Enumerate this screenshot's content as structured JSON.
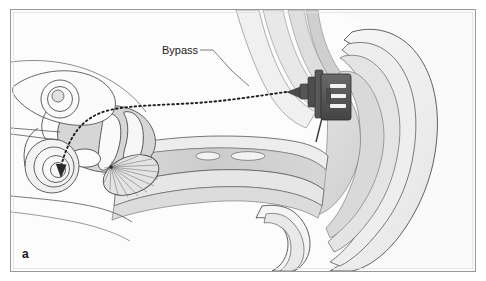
{
  "figure": {
    "domain": "Diagram",
    "panel_letter": "a",
    "background_color": "#ffffff",
    "frame": {
      "border_color": "#9a9a9a",
      "inner_border_color": "#d8d8d8",
      "x": 10,
      "y": 9,
      "width": 466,
      "height": 263
    },
    "annotations": [
      {
        "id": "bypass",
        "label": "Bypass",
        "text_x": 162,
        "text_y": 54,
        "leader_color": "#6f6f6f",
        "leader_path": "M 200 50 L 213 50 L 232 71 L 249 86"
      }
    ],
    "bypass_route": {
      "name": "bypass-dotted-path",
      "color": "#1e1e1e",
      "dash": "1.6 3.1",
      "width": 1.9,
      "path": "M 286 92 C 258 96 226 101 196 103 C 166 105 132 105 110 110 C 92 114 80 124 72 138 C 66 149 63 159 61 166",
      "arrow_points": "61,177 56.4,163.6 66.2,164.2",
      "arrow_color": "#2a2a2a"
    },
    "device": {
      "name": "implant-device",
      "body_color": "#595959",
      "body_stroke": "#2e2e2e",
      "mid_color": "#4e4e4e",
      "slot_color": "#f2f2f2",
      "taper_color": "#4a4a4a"
    },
    "palette": {
      "outline": "#4d4d4d",
      "outline_light": "#7d7d7d",
      "tissue_pale": "#f4f4f4",
      "tissue_light": "#ececec",
      "tissue_mid": "#e0e0e0",
      "tissue_grey": "#d4d4d4",
      "tissue_dark": "#c4c4c4",
      "canal_lumen": "#cfcfcf",
      "bone_fill": "#fbfbfb",
      "white": "#ffffff"
    },
    "structures": [
      {
        "id": "pinna-outer",
        "label": "Pinna (auricle) outer helix"
      },
      {
        "id": "pinna-helix-ridge",
        "label": "Helix ridge"
      },
      {
        "id": "pinna-antihelix",
        "label": "Antihelix"
      },
      {
        "id": "concha",
        "label": "Concha"
      },
      {
        "id": "ear-canal",
        "label": "External auditory canal"
      },
      {
        "id": "canal-gland-1",
        "label": "Ceruminous gland"
      },
      {
        "id": "canal-gland-2",
        "label": "Ceruminous gland"
      },
      {
        "id": "tympanic-membrane",
        "label": "Tympanic membrane (eardrum)"
      },
      {
        "id": "malleus",
        "label": "Malleus"
      },
      {
        "id": "incus",
        "label": "Incus"
      },
      {
        "id": "stapes",
        "label": "Stapes"
      },
      {
        "id": "cochlea",
        "label": "Cochlea"
      },
      {
        "id": "semicircular-canals",
        "label": "Semicircular canals"
      },
      {
        "id": "vestibule",
        "label": "Vestibule"
      },
      {
        "id": "eustachian-tube",
        "label": "Eustachian tube"
      },
      {
        "id": "tragus",
        "label": "Tragus"
      },
      {
        "id": "skull-tissue",
        "label": "Temporal bone and soft tissue"
      }
    ]
  }
}
